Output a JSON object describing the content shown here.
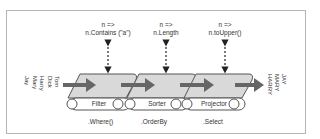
{
  "diagram": {
    "input_items": [
      "Tom",
      "Dick",
      "Harry",
      "Mary",
      "Jay"
    ],
    "output_items": [
      "JAY",
      "MARY",
      "HARRY"
    ],
    "stages": [
      {
        "name": "Filter",
        "operator": ".Where()",
        "lambda_head": "n =>",
        "lambda_body": "n.Contains (\"a\")"
      },
      {
        "name": "Sorter",
        "operator": ".OrderBy",
        "lambda_head": "n =>",
        "lambda_body": "n.Length"
      },
      {
        "name": "Projector",
        "operator": ".Select",
        "lambda_head": "n =>",
        "lambda_body": "n.toUpper()"
      }
    ],
    "colors": {
      "belt_fill": "#d9d9d9",
      "belt_stroke": "#555555",
      "arrow": "#666666",
      "frame": "#b5b5b5"
    }
  }
}
